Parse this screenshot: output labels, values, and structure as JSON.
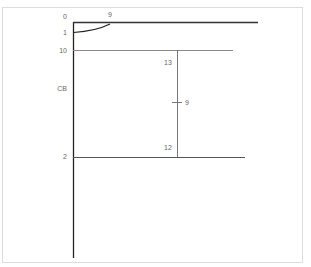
{
  "diagram": {
    "left_labels": [
      {
        "id": "top",
        "text": "0"
      },
      {
        "id": "arc-end",
        "text": "1"
      },
      {
        "id": "line-10",
        "text": "10"
      },
      {
        "id": "cb",
        "text": "CB"
      },
      {
        "id": "line-2",
        "text": "2"
      }
    ],
    "top_label": "9",
    "vertical_top_label": "13",
    "vertical_mid_label": "9",
    "vertical_bottom_label": "12",
    "colors": {
      "line_dark": "#222222",
      "line_gray": "#777777",
      "frame": "#dcdcdc",
      "text": "#666666"
    }
  }
}
